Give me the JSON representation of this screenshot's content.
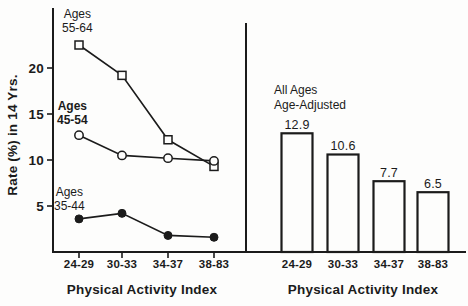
{
  "colors": {
    "ink": "#1b1b1b",
    "paper": "#fdfdfc"
  },
  "figure": {
    "left_panel": {
      "ylabel": "Rate (%) in 14 Yrs.",
      "xlabel": "Physical Activity Index",
      "series_labels": {
        "s1": "Ages\n55-64",
        "s2": "Ages\n45-54",
        "s3": "Ages\n35-44"
      }
    },
    "right_panel": {
      "annotation": "All Ages\nAge-Adjusted",
      "xlabel": "Physical Activity Index"
    }
  },
  "chart_data": [
    {
      "type": "line",
      "panel": "left",
      "categories": [
        "24-29",
        "30-33",
        "34-37",
        "38-83"
      ],
      "series": [
        {
          "name": "Ages 55-64",
          "marker": "open-square",
          "values": [
            22.5,
            19.2,
            12.2,
            9.3
          ]
        },
        {
          "name": "Ages 45-54",
          "marker": "open-circle",
          "values": [
            12.7,
            10.5,
            10.2,
            9.9
          ]
        },
        {
          "name": "Ages 35-44",
          "marker": "filled-circle",
          "values": [
            3.6,
            4.2,
            1.8,
            1.6
          ]
        }
      ],
      "xlabel": "Physical Activity Index",
      "ylabel": "Rate (%) in 14 Yrs.",
      "yticks": [
        5,
        10,
        15,
        20
      ],
      "ylim": [
        0,
        26.5
      ],
      "grid": false,
      "legend_position": "inline-annotations"
    },
    {
      "type": "bar",
      "panel": "right",
      "categories": [
        "24-29",
        "30-33",
        "34-37",
        "38-83"
      ],
      "values": [
        12.9,
        10.6,
        7.7,
        6.5
      ],
      "bar_labels": [
        "12.9",
        "10.6",
        "7.7",
        "6.5"
      ],
      "annotation": "All Ages Age-Adjusted",
      "xlabel": "Physical Activity Index",
      "ylim": [
        0,
        26.5
      ],
      "grid": false,
      "bar_fill": "#fdfdfc",
      "bar_outline": "#1b1b1b"
    }
  ]
}
